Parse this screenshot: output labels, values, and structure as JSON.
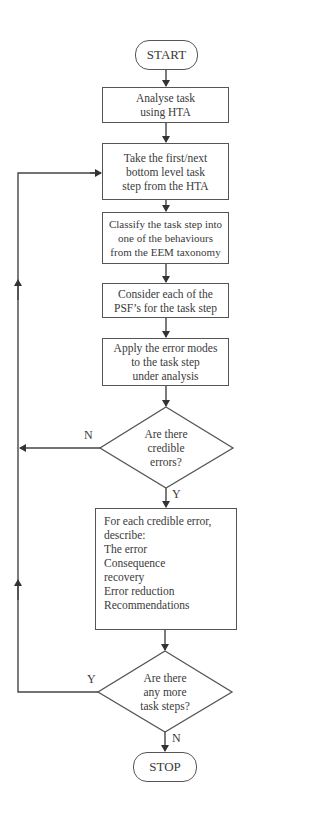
{
  "flowchart": {
    "start": "START",
    "stop": "STOP",
    "steps": [
      {
        "id": "analyse",
        "lines": [
          "Analyse task",
          "using HTA"
        ]
      },
      {
        "id": "take",
        "lines": [
          "Take the first/next",
          "bottom level task",
          "step from the HTA"
        ]
      },
      {
        "id": "classify",
        "lines": [
          "Classify the task step into",
          "one of the behaviours",
          "from the EEM taxonomy"
        ]
      },
      {
        "id": "consider",
        "lines": [
          "Consider each of the",
          "PSF’s for the task step"
        ]
      },
      {
        "id": "apply",
        "lines": [
          "Apply the error modes",
          "to the task step",
          "under analysis"
        ]
      }
    ],
    "decision_1": {
      "lines": [
        "Are there",
        "credible",
        "errors?"
      ],
      "no_label": "N",
      "yes_label": "Y"
    },
    "describe": {
      "lines": [
        "For each credible error,",
        "describe:",
        "The error",
        "Consequence",
        "recovery",
        "Error reduction",
        "Recommendations"
      ]
    },
    "decision_2": {
      "lines": [
        "Are there",
        "any more",
        "task steps?"
      ],
      "yes_label": "Y",
      "no_label": "N"
    },
    "colors": {
      "line": "#444444",
      "border": "#555555",
      "text": "#3a3a3a",
      "background": "#ffffff"
    }
  }
}
